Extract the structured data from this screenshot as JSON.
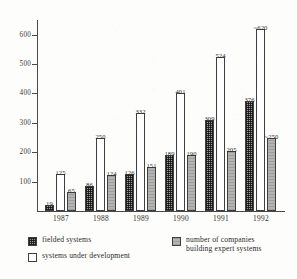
{
  "chart_data": {
    "type": "bar",
    "title": "",
    "subtitle": "",
    "xlabel": "",
    "ylabel": "",
    "categories": [
      "1987",
      "1988",
      "1989",
      "1990",
      "1991",
      "1992"
    ],
    "ylim": [
      0,
      650
    ],
    "yticks": [
      100,
      200,
      300,
      400,
      500,
      600
    ],
    "ytick_labels": [
      "100",
      "200",
      "300",
      "400",
      "500",
      "600"
    ],
    "grid": false,
    "legend_position": "bottom",
    "series": [
      {
        "name": "fielded systems",
        "key": "fielded",
        "fill": "checkered-dark",
        "values": [
          19,
          86,
          126,
          189,
          309,
          376
        ],
        "labels": [
          "19",
          "86",
          "126",
          "189",
          "309",
          "376"
        ]
      },
      {
        "name": "systems under development",
        "key": "under-dev",
        "fill": "white-outline",
        "values": [
          125,
          250,
          332,
          401,
          524,
          620
        ],
        "labels": [
          "125",
          "250",
          "332",
          "401",
          "524",
          "~620"
        ]
      },
      {
        "name": "number of companies building expert systems",
        "key": "companies",
        "fill": "solid-gray",
        "values": [
          65,
          124,
          151,
          190,
          205,
          250
        ],
        "labels": [
          "65",
          "124",
          "151",
          "190",
          "205",
          "~250"
        ]
      }
    ]
  },
  "legend": {
    "items": [
      {
        "label": "fielded systems",
        "key": "fielded"
      },
      {
        "label": "systems under development",
        "key": "under-dev"
      },
      {
        "label": "number of companies\nbuilding expert systems",
        "key": "companies"
      }
    ]
  }
}
